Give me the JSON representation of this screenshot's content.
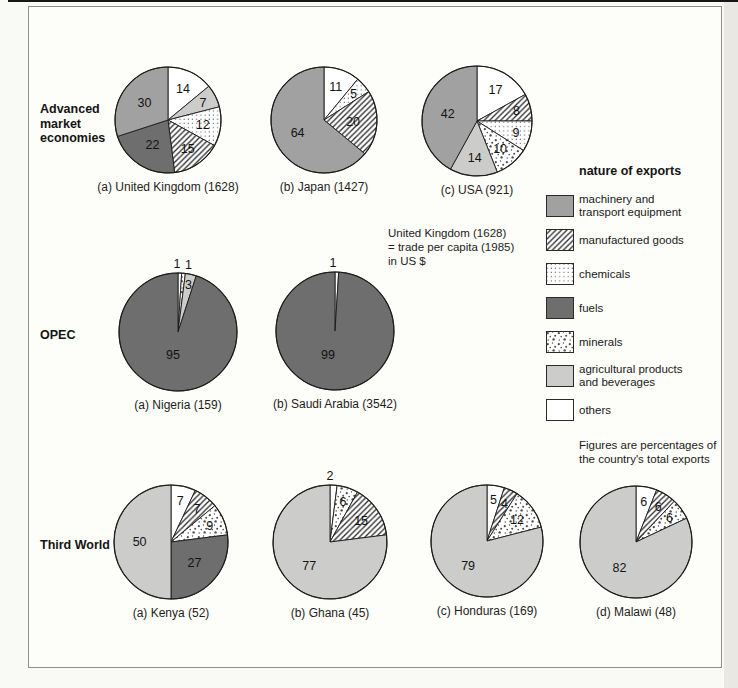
{
  "figure": {
    "legend_title": "nature of exports",
    "legend_note": "Figures are percentages of\nthe country's total exports",
    "callout_note": "United Kingdom (1628)\n= trade per capita (1985)\nin US $",
    "groups": [
      {
        "label": "Advanced market economies"
      },
      {
        "label": "OPEC"
      },
      {
        "label": "Third World"
      }
    ]
  },
  "colors": {
    "machinery": "#a1a1a1",
    "fuels": "#6e6e6e",
    "agricultural": "#cccccb",
    "others": "#ffffff",
    "pattern_ink": "#3c3c3c",
    "outline": "#1c1c1c",
    "frame_border": "#8f8f8a",
    "page_background": "#f9f9f5"
  },
  "legend_items": [
    {
      "key": "machinery",
      "label": "machinery and transport equipment"
    },
    {
      "key": "manufactured",
      "label": "manufactured goods"
    },
    {
      "key": "chemicals",
      "label": "chemicals"
    },
    {
      "key": "fuels",
      "label": "fuels"
    },
    {
      "key": "minerals",
      "label": "minerals"
    },
    {
      "key": "agricultural",
      "label": "agricultural products and beverages"
    },
    {
      "key": "others",
      "label": "others"
    }
  ],
  "chart_data": [
    {
      "type": "pie",
      "group": "Advanced market economies",
      "caption": "(a) United Kingdom (1628)",
      "country": "United Kingdom",
      "trade_per_capita_1985_usd": 1628,
      "unit": "percent of total exports",
      "slices": [
        {
          "key": "others",
          "value": 14
        },
        {
          "key": "agricultural",
          "value": 7
        },
        {
          "key": "chemicals",
          "value": 12
        },
        {
          "key": "manufactured",
          "value": 15
        },
        {
          "key": "fuels",
          "value": 22
        },
        {
          "key": "machinery",
          "value": 30
        }
      ]
    },
    {
      "type": "pie",
      "group": "Advanced market economies",
      "caption": "(b) Japan (1427)",
      "country": "Japan",
      "trade_per_capita_1985_usd": 1427,
      "unit": "percent of total exports",
      "slices": [
        {
          "key": "others",
          "value": 11
        },
        {
          "key": "chemicals",
          "value": 5
        },
        {
          "key": "manufactured",
          "value": 20
        },
        {
          "key": "machinery",
          "value": 64
        }
      ]
    },
    {
      "type": "pie",
      "group": "Advanced market economies",
      "caption": "(c) USA (921)",
      "country": "USA",
      "trade_per_capita_1985_usd": 921,
      "unit": "percent of total exports",
      "slices": [
        {
          "key": "others",
          "value": 17
        },
        {
          "key": "manufactured",
          "value": 8
        },
        {
          "key": "chemicals",
          "value": 9
        },
        {
          "key": "minerals",
          "value": 10
        },
        {
          "key": "agricultural",
          "value": 14
        },
        {
          "key": "machinery",
          "value": 42
        }
      ]
    },
    {
      "type": "pie",
      "group": "OPEC",
      "caption": "(a) Nigeria (159)",
      "country": "Nigeria",
      "trade_per_capita_1985_usd": 159,
      "unit": "percent of total exports",
      "slices": [
        {
          "key": "others",
          "value": 1,
          "label_dx": -3
        },
        {
          "key": "minerals",
          "value": 1,
          "label_dx": 4
        },
        {
          "key": "agricultural",
          "value": 3
        },
        {
          "key": "fuels",
          "value": 95,
          "label_dy": -9
        }
      ]
    },
    {
      "type": "pie",
      "group": "OPEC",
      "caption": "(b) Saudi Arabia (3542)",
      "country": "Saudi Arabia",
      "trade_per_capita_1985_usd": 3542,
      "unit": "percent of total exports",
      "slices": [
        {
          "key": "others",
          "value": 1,
          "label_dx": -4
        },
        {
          "key": "fuels",
          "value": 99,
          "label_dx": -6,
          "label_dy": -9
        }
      ]
    },
    {
      "type": "pie",
      "group": "Third World",
      "caption": "(a) Kenya (52)",
      "country": "Kenya",
      "trade_per_capita_1985_usd": 52,
      "unit": "percent of total exports",
      "slices": [
        {
          "key": "others",
          "value": 7
        },
        {
          "key": "manufactured",
          "value": 7
        },
        {
          "key": "minerals",
          "value": 9
        },
        {
          "key": "fuels",
          "value": 27
        },
        {
          "key": "agricultural",
          "value": 50
        }
      ]
    },
    {
      "type": "pie",
      "group": "Third World",
      "caption": "(b) Ghana (45)",
      "country": "Ghana",
      "trade_per_capita_1985_usd": 45,
      "unit": "percent of total exports",
      "slices": [
        {
          "key": "others",
          "value": 2,
          "label_dx": -4
        },
        {
          "key": "minerals",
          "value": 6
        },
        {
          "key": "manufactured",
          "value": 15
        },
        {
          "key": "agricultural",
          "value": 77
        }
      ]
    },
    {
      "type": "pie",
      "group": "Third World",
      "caption": "(c) Honduras (169)",
      "country": "Honduras",
      "trade_per_capita_1985_usd": 169,
      "unit": "percent of total exports",
      "slices": [
        {
          "key": "others",
          "value": 5
        },
        {
          "key": "manufactured",
          "value": 4
        },
        {
          "key": "minerals",
          "value": 12
        },
        {
          "key": "agricultural",
          "value": 79
        }
      ]
    },
    {
      "type": "pie",
      "group": "Third World",
      "caption": "(d) Malawi (48)",
      "country": "Malawi",
      "trade_per_capita_1985_usd": 48,
      "unit": "percent of total exports",
      "slices": [
        {
          "key": "others",
          "value": 6
        },
        {
          "key": "manufactured",
          "value": 6
        },
        {
          "key": "minerals",
          "value": 6
        },
        {
          "key": "agricultural",
          "value": 82
        }
      ]
    }
  ]
}
